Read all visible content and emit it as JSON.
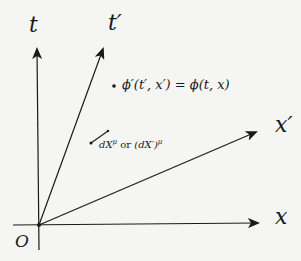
{
  "diagram": {
    "title": "",
    "colors": {
      "background": "#f5f5f3",
      "ink": "#1a1a1a"
    },
    "origin": {
      "label": "O",
      "x": 39,
      "y": 225
    },
    "axes": [
      {
        "id": "t",
        "label": "t",
        "from": [
          39,
          250
        ],
        "to": [
          37,
          48
        ],
        "arrow": true
      },
      {
        "id": "t_prime",
        "label": "t′",
        "from": [
          39,
          225
        ],
        "to": [
          103,
          48
        ],
        "arrow": true
      },
      {
        "id": "x_prime",
        "label": "x′",
        "from": [
          39,
          225
        ],
        "to": [
          256,
          132
        ],
        "arrow": true
      },
      {
        "id": "x",
        "label": "x",
        "from": [
          13,
          225
        ],
        "to": [
          258,
          223
        ],
        "arrow": true
      }
    ],
    "point": {
      "x": 114,
      "y": 86,
      "label": "ϕ′(t′, x′) = ϕ(t, x)"
    },
    "displacement": {
      "from": [
        91,
        143
      ],
      "to": [
        108,
        131
      ],
      "label": "dXμ or (dX′)μ",
      "label_parts": {
        "dx": "dX",
        "mu": "μ",
        "or": " or ",
        "dxp": "(dX′)",
        "mu2": "μ"
      }
    }
  }
}
